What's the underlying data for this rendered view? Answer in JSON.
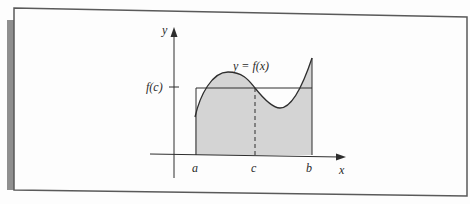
{
  "figure": {
    "kind": "Mean Value Theorem for Integrals illustration",
    "labels": {
      "y_axis": "y",
      "x_axis": "x",
      "curve": "y = f(x)",
      "f_of_c": "f(c)",
      "a": "a",
      "c": "c",
      "b": "b"
    },
    "colors": {
      "shade": "#d4d4d4",
      "line": "#2e2e2e",
      "frame": "#5a5a5a",
      "side_bar": "#8f8f8f",
      "background": "#fdfdfd"
    }
  }
}
